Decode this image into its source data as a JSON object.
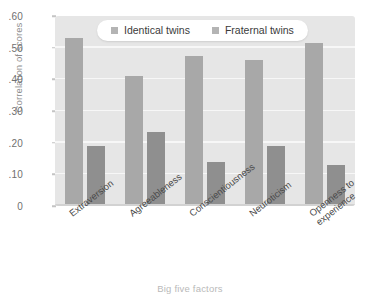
{
  "chart_data": {
    "type": "bar",
    "title": "",
    "xlabel": "Big five factors",
    "ylabel": "Correlation of scores",
    "categories": [
      "Extraversion",
      "Agreeableness",
      "Conscientiousness",
      "Neuroticism",
      "Openness to\nexperience"
    ],
    "series": [
      {
        "name": "Identical twins",
        "color": "#a8a8a8",
        "values": [
          0.53,
          0.41,
          0.475,
          0.46,
          0.515
        ]
      },
      {
        "name": "Fraternal twins",
        "color": "#8f8f8f",
        "values": [
          0.19,
          0.235,
          0.14,
          0.19,
          0.13
        ]
      }
    ],
    "ylim": [
      0,
      0.6
    ],
    "ytick_values": [
      0,
      0.1,
      0.2,
      0.3,
      0.4,
      0.5,
      0.6
    ],
    "ytick_labels": [
      "0",
      ".10",
      ".20",
      ".30",
      ".40",
      ".50",
      ".60"
    ],
    "grid": true,
    "legend_position": "top-center"
  },
  "legend": {
    "items": [
      {
        "label": "Identical twins",
        "swatch": "legend-swatch-identical"
      },
      {
        "label": "Fraternal twins",
        "swatch": "legend-swatch-fraternal"
      }
    ]
  },
  "colors": {
    "plot_background": "#e6e6e6",
    "gridline": "#f7f7f7",
    "identical_bar": "#a8a8a8",
    "fraternal_bar": "#8f8f8f",
    "axis_text": "#6f6f6f",
    "axis_title": "#8d8d8d",
    "xaxis_title": "#b9b9b9"
  }
}
